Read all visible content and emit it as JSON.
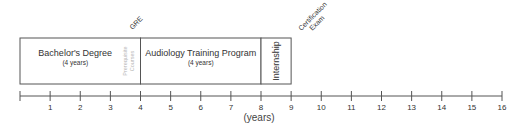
{
  "diagram": {
    "type": "timeline",
    "axis": {
      "min": 0,
      "max": 16,
      "ticks": [
        0,
        1,
        2,
        3,
        4,
        5,
        6,
        7,
        8,
        9,
        10,
        11,
        12,
        13,
        14,
        15,
        16
      ],
      "tick_labels": [
        "",
        "1",
        "2",
        "3",
        "4",
        "5",
        "6",
        "7",
        "8",
        "9",
        "10",
        "11",
        "12",
        "13",
        "14",
        "15",
        "16"
      ],
      "unit_label": "(years)",
      "unit_label_at": 8
    },
    "phases": [
      {
        "id": "bachelors",
        "title": "Bachelor's Degree",
        "subtitle": "(4 years)",
        "start": 0,
        "end": 4,
        "orientation": "horizontal"
      },
      {
        "id": "audiology",
        "title": "Audiology Training Program",
        "subtitle": "(4 years)",
        "start": 4,
        "end": 8,
        "orientation": "horizontal"
      },
      {
        "id": "internship",
        "title": "Internship",
        "subtitle": "",
        "start": 8,
        "end": 9,
        "orientation": "vertical"
      }
    ],
    "inner_notes": [
      {
        "id": "prerequisite",
        "lines": [
          "Prerequisite",
          "Courses"
        ],
        "at": 3.55,
        "color": "#b8b8b8"
      }
    ],
    "milestones": [
      {
        "id": "gre",
        "lines": [
          "GRE"
        ],
        "at": 3.6
      },
      {
        "id": "certification",
        "lines": [
          "Certification",
          "Exam"
        ],
        "at": 9.3
      }
    ],
    "colors": {
      "line": "#555555",
      "text": "#333333",
      "faint": "#b8b8b8"
    }
  }
}
